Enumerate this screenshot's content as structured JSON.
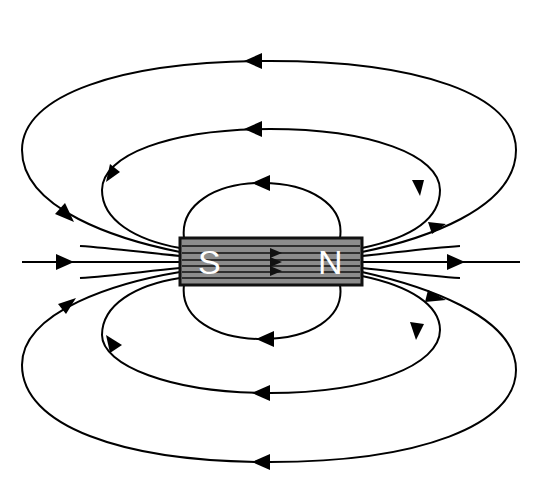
{
  "diagram": {
    "magnet": {
      "south_label": "S",
      "north_label": "N",
      "fill_color": "#8c8c8c",
      "border_color": "#111111",
      "label_color": "#ffffff"
    },
    "field_lines": {
      "color": "#000000",
      "count_above": 3,
      "count_below": 3,
      "axis_line": true,
      "direction": "exit N, enter S (outside magnet); S to N inside magnet"
    }
  }
}
